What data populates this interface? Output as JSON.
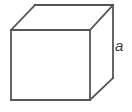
{
  "figure": {
    "name": "cube-diagram",
    "caption": "",
    "canvas": {
      "width": 132,
      "height": 112,
      "background_color": "#ffffff"
    },
    "style": {
      "stroke_color": "#555555",
      "stroke_width": 1.8,
      "face_fill": "#ffffff",
      "label_color": "#3d3d3d"
    },
    "shape": {
      "type": "cube",
      "projection": "oblique",
      "vertices": {
        "front_top_left": [
          11,
          30
        ],
        "front_top_right": [
          90,
          30
        ],
        "front_bottom_right": [
          90,
          100
        ],
        "front_bottom_left": [
          11,
          100
        ],
        "back_top_left": [
          35,
          5
        ],
        "back_top_right": [
          113,
          5
        ],
        "back_bottom_right": [
          113,
          78
        ]
      },
      "faces": {
        "front": "11,30 90,30 90,100 11,100",
        "top": "11,30 35,5 113,5 90,30",
        "right": "90,30 113,5 113,78 90,100"
      },
      "edges": [
        {
          "name": "front-top",
          "points": "11,30 90,30"
        },
        {
          "name": "front-right",
          "points": "90,30 90,100"
        },
        {
          "name": "front-bottom",
          "points": "90,100 11,100"
        },
        {
          "name": "front-left",
          "points": "11,100 11,30"
        },
        {
          "name": "top-back",
          "points": "35,5 113,5"
        },
        {
          "name": "top-left-diagonal",
          "points": "11,30 35,5"
        },
        {
          "name": "top-right-diagonal",
          "points": "90,30 113,5"
        },
        {
          "name": "back-right-vertical",
          "points": "113,5 113,78"
        },
        {
          "name": "bottom-right-diagonal",
          "points": "90,100 113,78"
        }
      ]
    },
    "labels": [
      {
        "id": "edge-a",
        "text": "a",
        "style": "italic",
        "x": 117,
        "y": 46,
        "describes": "cube-edge-length"
      }
    ]
  }
}
